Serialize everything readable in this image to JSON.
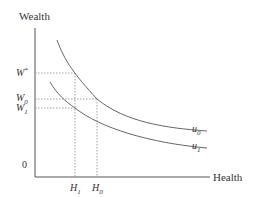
{
  "diagram": {
    "y_axis_label": "Wealth",
    "x_axis_label": "Health",
    "origin_label": "0",
    "y_ticks": [
      {
        "base": "W",
        "mark": "*",
        "kind": "sup"
      },
      {
        "base": "W",
        "mark": "0",
        "kind": "sub"
      },
      {
        "base": "W",
        "mark": "1",
        "kind": "sub"
      }
    ],
    "x_ticks": [
      {
        "base": "H",
        "mark": "1"
      },
      {
        "base": "H",
        "mark": "0"
      }
    ],
    "curves": [
      {
        "base": "u",
        "mark": "0",
        "desc": "upper indifference curve"
      },
      {
        "base": "u",
        "mark": "1",
        "desc": "lower indifference curve"
      }
    ],
    "colors": {
      "axis": "#555555",
      "curve": "#666666",
      "guide": "#888888"
    }
  }
}
